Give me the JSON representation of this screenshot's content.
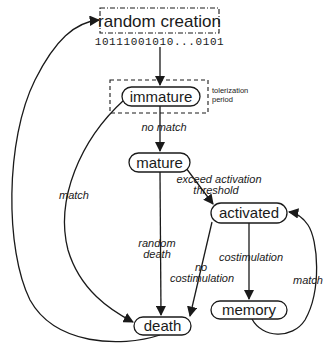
{
  "diagram": {
    "type": "state-transition",
    "nodes": {
      "random_creation": {
        "label": "random creation",
        "bits": "10111001010...0101"
      },
      "immature": {
        "label": "immature",
        "annotation": {
          "line1": "tolerization",
          "line2": "period"
        }
      },
      "mature": {
        "label": "mature"
      },
      "activated": {
        "label": "activated"
      },
      "memory": {
        "label": "memory"
      },
      "death": {
        "label": "death"
      }
    },
    "edges": {
      "creation_to_immature": {
        "from": "random creation",
        "to": "immature",
        "label": ""
      },
      "immature_to_mature": {
        "from": "immature",
        "to": "mature",
        "label": "no match"
      },
      "immature_to_death": {
        "from": "immature",
        "to": "death",
        "label": "match"
      },
      "mature_to_activated": {
        "from": "mature",
        "to": "activated",
        "label_line1": "exceed activation",
        "label_line2": "threshold"
      },
      "mature_to_death": {
        "from": "mature",
        "to": "death",
        "label_line1": "random",
        "label_line2": "death"
      },
      "activated_to_death": {
        "from": "activated",
        "to": "death",
        "label_line1": "no",
        "label_line2": "costimulation"
      },
      "activated_to_memory": {
        "from": "activated",
        "to": "memory",
        "label": "costimulation"
      },
      "memory_to_activated": {
        "from": "memory",
        "to": "activated",
        "label": "match"
      },
      "death_to_creation": {
        "from": "death",
        "to": "random creation",
        "label": ""
      }
    }
  }
}
